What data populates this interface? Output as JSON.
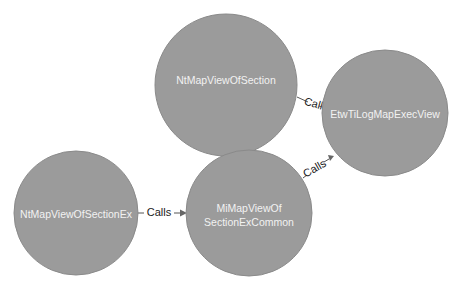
{
  "diagram": {
    "colors": {
      "node_fill": "#9b9b9b",
      "node_text": "#f2f2f2",
      "edge": "#555555",
      "edge_label": "#222222",
      "background": "#ffffff"
    },
    "nodes": [
      {
        "id": "ntmapviewofsection",
        "label": "NtMapViewOfSection",
        "lines": [
          "NtMapViewOfSection"
        ],
        "cx": 226,
        "cy": 85,
        "r": 71
      },
      {
        "id": "etwtilogmapexecview",
        "label": "EtwTiLogMapExecView",
        "lines": [
          "EtwTiLogMapExecView"
        ],
        "cx": 385,
        "cy": 113,
        "r": 63
      },
      {
        "id": "ntmapviewofsectionex",
        "label": "NtMapViewOfSectionEx",
        "lines": [
          "NtMapViewOfSectionEx"
        ],
        "cx": 76,
        "cy": 213,
        "r": 62
      },
      {
        "id": "mimapviewofsectionexcommon",
        "label": "MiMapViewOfSectionExCommon",
        "lines": [
          "MiMapViewOf",
          "SectionExCommon"
        ],
        "cx": 249,
        "cy": 213,
        "r": 63
      }
    ],
    "edges": [
      {
        "from": "ntmapviewofsection",
        "to": "etwtilogmapexecview",
        "label": "Calls"
      },
      {
        "from": "ntmapviewofsectionex",
        "to": "mimapviewofsectionexcommon",
        "label": "Calls"
      },
      {
        "from": "mimapviewofsectionexcommon",
        "to": "etwtilogmapexecview",
        "label": "Calls"
      }
    ]
  },
  "labels": {
    "node_top": "NtMapViewOfSection",
    "node_right": "EtwTiLogMapExecView",
    "node_left": "NtMapViewOfSectionEx",
    "node_middle_line1": "MiMapViewOf",
    "node_middle_line2": "SectionExCommon",
    "edge_top_to_right": "Calls",
    "edge_left_to_middle": "Calls",
    "edge_middle_to_right": "Calls"
  }
}
